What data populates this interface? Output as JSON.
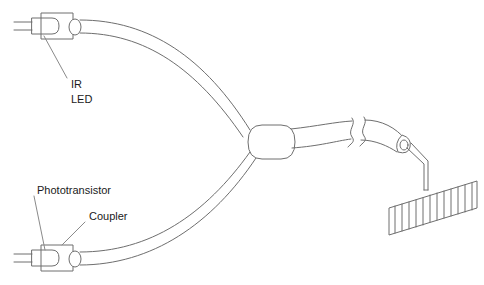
{
  "figure": {
    "background_color": "#ffffff",
    "line_color": "#6e6e6e",
    "text_color": "#1a1a1a",
    "width": 484,
    "height": 285
  },
  "labels": {
    "ir_led_line1": "IR",
    "ir_led_line2": "LED",
    "phototransistor": "Phototransistor",
    "coupler": "Coupler"
  },
  "components": {
    "ir_led_source": {
      "name": "IR LED",
      "position": "top-left",
      "lead_count": 2
    },
    "phototransistor_detector": {
      "name": "Phototransistor",
      "position": "bottom-left",
      "lead_count": 2
    },
    "coupler_junction": {
      "name": "Coupler",
      "shape": "stadium",
      "input_fibers": 2,
      "output_fibers": 1
    },
    "cable_break": {
      "name": "break symbol",
      "meaning": "omitted cable length"
    },
    "probe_tip": {
      "name": "probe ferrule",
      "position": "right"
    },
    "striped_target": {
      "name": "striped encoder strip",
      "stripe_count": 13
    }
  }
}
